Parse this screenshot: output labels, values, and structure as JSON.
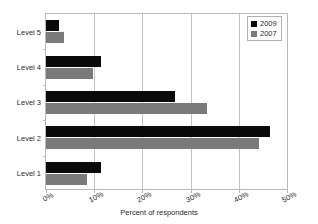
{
  "chart_data": {
    "type": "bar",
    "orientation": "horizontal",
    "title": "",
    "xlabel": "Percent of respondents",
    "ylabel": "",
    "xlim": [
      0,
      50
    ],
    "xticks": [
      "0%",
      "10%",
      "20%",
      "30%",
      "40%",
      "50%"
    ],
    "xtick_values": [
      0,
      10,
      20,
      30,
      40,
      50
    ],
    "grid": true,
    "legend_position": "top-right",
    "categories": [
      "Level 1",
      "Level 2",
      "Level 3",
      "Level 4",
      "Level 5"
    ],
    "category_order_top_to_bottom": [
      "Level 5",
      "Level 4",
      "Level 3",
      "Level 2",
      "Level 1"
    ],
    "series": [
      {
        "name": "2009",
        "color": "#0a0a0a",
        "values": [
          11.5,
          46.5,
          26.8,
          11.4,
          2.7
        ]
      },
      {
        "name": "2007",
        "color": "#7a7a7a",
        "values": [
          8.6,
          44.2,
          33.3,
          9.8,
          3.8
        ]
      }
    ]
  },
  "legend": {
    "items": [
      {
        "label": "2009"
      },
      {
        "label": "2007"
      }
    ]
  },
  "axis": {
    "x_title": "Percent of respondents"
  }
}
